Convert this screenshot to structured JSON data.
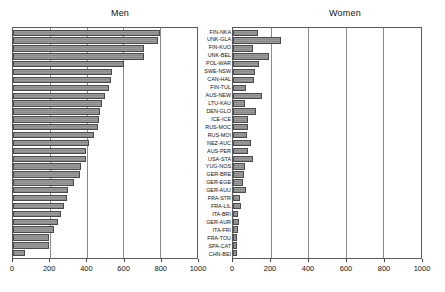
{
  "figure": {
    "panels": {
      "men": {
        "title": "Men"
      },
      "women": {
        "title": "Women"
      }
    },
    "axis": {
      "min": 0,
      "max": 1000,
      "ticks": [
        0,
        200,
        400,
        600,
        800,
        1000
      ],
      "tick_labels": [
        "0",
        "200",
        "400",
        "600",
        "800",
        "1000"
      ]
    }
  },
  "chart_data": {
    "type": "bar",
    "orientation": "horizontal",
    "title": "",
    "subtitle": "",
    "xlabel": "",
    "ylabel": "",
    "xlim": [
      0,
      1000
    ],
    "grid": true,
    "legend": false,
    "panel_titles": [
      "Men",
      "Women"
    ],
    "categories": [
      "FIN-NKA",
      "UNK-GLA",
      "FIN-KUO",
      "UNK-BEL",
      "POL-WAR",
      "SWE-NSW",
      "CAN-HAL",
      "FIN-TUL",
      "AUS-NEW",
      "LTU-KAU",
      "DEN-GLO",
      "ICE-ICE",
      "RUS-MOC",
      "RUS-MOI",
      "NEZ-AUC",
      "AUS-PER",
      "USA-STA",
      "YUG-NOS",
      "GER-BRE",
      "GER-EGE",
      "GER-AUU",
      "FRA-STR",
      "FRA-LIL",
      "ITA-BRI",
      "GER-AUR",
      "ITA-FRI",
      "FRA-TOU",
      "SPA-CAT",
      "CHN-BEI"
    ],
    "series": [
      {
        "name": "Men",
        "values": [
          800,
          789,
          713,
          710,
          603,
          539,
          535,
          522,
          502,
          483,
          474,
          468,
          464,
          440,
          414,
          399,
          396,
          370,
          362,
          332,
          298,
          292,
          277,
          263,
          242,
          225,
          196,
          193,
          66
        ]
      },
      {
        "name": "Women",
        "values": [
          133,
          256,
          104,
          190,
          140,
          116,
          114,
          71,
          153,
          63,
          120,
          81,
          80,
          73,
          94,
          82,
          108,
          66,
          56,
          53,
          68,
          39,
          43,
          25,
          33,
          28,
          21,
          20,
          19
        ]
      }
    ]
  }
}
